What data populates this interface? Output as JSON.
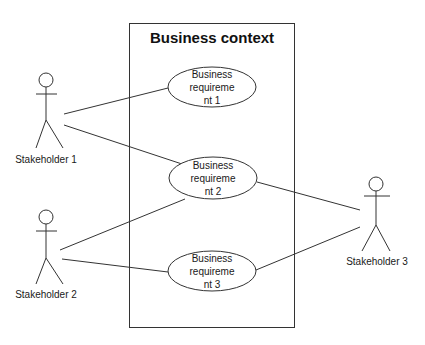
{
  "diagram": {
    "type": "use-case",
    "boundary": {
      "title": "Business context"
    },
    "actors": [
      {
        "id": "s1",
        "label": "Stakeholder 1"
      },
      {
        "id": "s2",
        "label": "Stakeholder 2"
      },
      {
        "id": "s3",
        "label": "Stakeholder 3"
      }
    ],
    "use_cases": [
      {
        "id": "br1",
        "line1": "Business requireme",
        "line2": "nt 1"
      },
      {
        "id": "br2",
        "line1": "Business requireme",
        "line2": "nt 2"
      },
      {
        "id": "br3",
        "line1": "Business requireme",
        "line2": "nt 3"
      }
    ],
    "associations": [
      [
        "s1",
        "br1"
      ],
      [
        "s1",
        "br2"
      ],
      [
        "s2",
        "br2"
      ],
      [
        "s2",
        "br3"
      ],
      [
        "s3",
        "br2"
      ],
      [
        "s3",
        "br3"
      ]
    ],
    "colors": {
      "stroke": "#333333",
      "background": "#ffffff"
    }
  }
}
